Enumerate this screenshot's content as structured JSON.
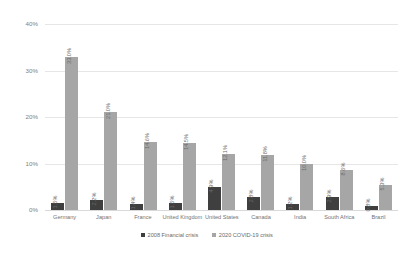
{
  "chart_data": {
    "type": "bar",
    "title": "",
    "xlabel": "",
    "ylabel": "",
    "ylim": [
      0,
      40
    ],
    "ytick_labels": [
      "0%",
      "10%",
      "20%",
      "30%",
      "40%"
    ],
    "ytick_values": [
      0,
      10,
      20,
      30,
      40
    ],
    "grid": true,
    "legend_position": "bottom",
    "categories": [
      "Germany",
      "Japan",
      "France",
      "United Kingdom",
      "United States",
      "Canada",
      "India",
      "South Africa",
      "Brazil"
    ],
    "series": [
      {
        "name": "2008 Financial crisis",
        "color": "#3f3f3f",
        "values": [
          1.5,
          2.2,
          1.4,
          1.5,
          4.9,
          2.8,
          1.2,
          2.9,
          0.8
        ],
        "labels": [
          "1.5%",
          "2.2%",
          "1.4%",
          "1.5%",
          "4.9%",
          "2.8%",
          "1.2%",
          "2.9%",
          "0.8%"
        ]
      },
      {
        "name": "2020 COVID-19 crisis",
        "color": "#a6a6a6",
        "values": [
          33.0,
          21.0,
          14.6,
          14.5,
          12.1,
          11.8,
          10.0,
          8.6,
          5.3
        ],
        "labels": [
          "33.0%",
          "21.0%",
          "14.6%",
          "14.5%",
          "12.1%",
          "11.8%",
          "10.0%",
          "8.6%",
          "5.3%"
        ]
      }
    ]
  }
}
